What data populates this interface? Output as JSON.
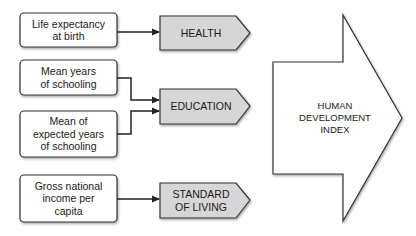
{
  "indicators": [
    {
      "label": "Life expectancy\nat birth"
    },
    {
      "label": "Mean years\nof schooling"
    },
    {
      "label": "Mean of\nexpected years\nof schooling"
    },
    {
      "label": "Gross national\nincome per\ncapita"
    }
  ],
  "dimensions": [
    {
      "label": "HEALTH"
    },
    {
      "label": "EDUCATION"
    },
    {
      "label": "STANDARD\nOF LIVING"
    }
  ],
  "index": {
    "label": "HUMAN\nDEVELOPMENT\nINDEX"
  },
  "colors": {
    "dimension_fill": "#d6d6d6",
    "stroke": "#333333",
    "box_fill": "#ffffff"
  }
}
